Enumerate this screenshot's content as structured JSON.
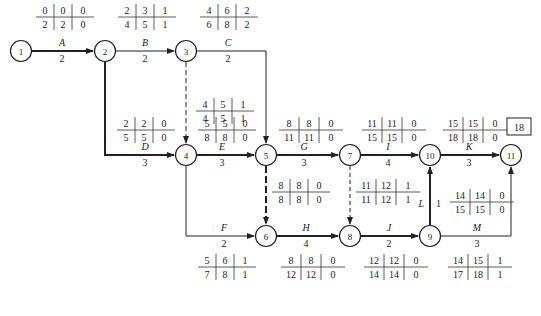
{
  "total_duration": "18",
  "nodes": [
    {
      "id": "1",
      "x": 21,
      "y": 51
    },
    {
      "id": "2",
      "x": 105,
      "y": 51
    },
    {
      "id": "3",
      "x": 186,
      "y": 51
    },
    {
      "id": "4",
      "x": 186,
      "y": 155
    },
    {
      "id": "5",
      "x": 266,
      "y": 155
    },
    {
      "id": "6",
      "x": 266,
      "y": 236
    },
    {
      "id": "7",
      "x": 350,
      "y": 155
    },
    {
      "id": "8",
      "x": 350,
      "y": 236
    },
    {
      "id": "9",
      "x": 430,
      "y": 236
    },
    {
      "id": "10",
      "x": 430,
      "y": 155
    },
    {
      "id": "11",
      "x": 511,
      "y": 155
    }
  ],
  "activities": [
    {
      "name": "A",
      "duration": "2",
      "from": "1",
      "to": "2",
      "critical": true,
      "es": "0",
      "ef": "2",
      "tf": "0",
      "ls": "0",
      "lf": "2",
      "ff": "0"
    },
    {
      "name": "B",
      "duration": "2",
      "from": "2",
      "to": "3",
      "critical": false,
      "es": "2",
      "ef": "4",
      "ls": "3",
      "lf": "5",
      "tf": "1",
      "ff": "1"
    },
    {
      "name": "C",
      "duration": "2",
      "from": "3",
      "to": "5",
      "critical": false,
      "es": "4",
      "ef": "6",
      "ls": "6",
      "lf": "8",
      "tf": "2",
      "ff": "2"
    },
    {
      "name": "D",
      "duration": "3",
      "from": "2",
      "to": "4",
      "critical": true,
      "es": "2",
      "ef": "5",
      "ls": "2",
      "lf": "5",
      "tf": "0",
      "ff": "0"
    },
    {
      "name": "E",
      "duration": "3",
      "from": "4",
      "to": "5",
      "critical": true,
      "es": "5",
      "ef": "8",
      "ls": "5",
      "lf": "8",
      "tf": "0",
      "ff": "0"
    },
    {
      "name": "F",
      "duration": "2",
      "from": "4",
      "to": "6",
      "critical": false,
      "es": "5",
      "ef": "7",
      "ls": "6",
      "lf": "8",
      "tf": "1",
      "ff": "1"
    },
    {
      "name": "G",
      "duration": "3",
      "from": "5",
      "to": "7",
      "critical": true,
      "es": "8",
      "ef": "11",
      "ls": "8",
      "lf": "11",
      "tf": "0",
      "ff": "0"
    },
    {
      "name": "H",
      "duration": "4",
      "from": "6",
      "to": "8",
      "critical": true,
      "es": "8",
      "ef": "12",
      "ls": "8",
      "lf": "12",
      "tf": "0",
      "ff": "0"
    },
    {
      "name": "I",
      "duration": "4",
      "from": "7",
      "to": "10",
      "critical": true,
      "es": "11",
      "ef": "15",
      "ls": "11",
      "lf": "15",
      "tf": "0",
      "ff": "0"
    },
    {
      "name": "J",
      "duration": "2",
      "from": "8",
      "to": "9",
      "critical": true,
      "es": "12",
      "ef": "14",
      "ls": "12",
      "lf": "14",
      "tf": "0",
      "ff": "0"
    },
    {
      "name": "K",
      "duration": "3",
      "from": "10",
      "to": "11",
      "critical": true,
      "es": "15",
      "ef": "18",
      "ls": "15",
      "lf": "18",
      "tf": "0",
      "ff": "0"
    },
    {
      "name": "L",
      "duration": "1",
      "from": "9",
      "to": "10",
      "critical": true,
      "es": "14",
      "ef": "15",
      "ls": "14",
      "lf": "15",
      "tf": "0",
      "ff": "0"
    },
    {
      "name": "M",
      "duration": "3",
      "from": "9",
      "to": "11",
      "critical": false,
      "es": "14",
      "ef": "17",
      "ls": "15",
      "lf": "18",
      "tf": "1",
      "ff": "1"
    }
  ],
  "dummies": [
    {
      "from": "3",
      "to": "4",
      "critical": false,
      "es": "4",
      "ef": "4",
      "ls": "5",
      "lf": "5",
      "tf": "1",
      "ff": "1"
    },
    {
      "from": "5",
      "to": "6",
      "critical": true,
      "es": "8",
      "ef": "8",
      "ls": "8",
      "lf": "8",
      "tf": "0",
      "ff": "0"
    },
    {
      "from": "7",
      "to": "8",
      "critical": false,
      "es": "11",
      "ef": "11",
      "ls": "12",
      "lf": "12",
      "tf": "1",
      "ff": "1"
    }
  ],
  "tables": {
    "A": {
      "r1": [
        "0",
        "0",
        "0"
      ],
      "r2": [
        "2",
        "2",
        "0"
      ]
    },
    "B": {
      "r1": [
        "2",
        "3",
        "1"
      ],
      "r2": [
        "4",
        "5",
        "1"
      ]
    },
    "C": {
      "r1": [
        "4",
        "6",
        "2"
      ],
      "r2": [
        "6",
        "8",
        "2"
      ]
    },
    "D": {
      "r1": [
        "2",
        "2",
        "0"
      ],
      "r2": [
        "5",
        "5",
        "0"
      ]
    },
    "E": {
      "r1": [
        "5",
        "5",
        "0"
      ],
      "r2": [
        "8",
        "8",
        "0"
      ]
    },
    "F": {
      "r1": [
        "5",
        "6",
        "1"
      ],
      "r2": [
        "7",
        "8",
        "1"
      ]
    },
    "G": {
      "r1": [
        "8",
        "8",
        "0"
      ],
      "r2": [
        "11",
        "11",
        "0"
      ]
    },
    "H": {
      "r1": [
        "8",
        "8",
        "0"
      ],
      "r2": [
        "12",
        "12",
        "0"
      ]
    },
    "I": {
      "r1": [
        "11",
        "11",
        "0"
      ],
      "r2": [
        "15",
        "15",
        "0"
      ]
    },
    "J": {
      "r1": [
        "12",
        "12",
        "0"
      ],
      "r2": [
        "14",
        "14",
        "0"
      ]
    },
    "K": {
      "r1": [
        "15",
        "15",
        "0"
      ],
      "r2": [
        "18",
        "18",
        "0"
      ]
    },
    "L": {
      "r1": [
        "14",
        "14",
        "0"
      ],
      "r2": [
        "15",
        "15",
        "0"
      ]
    },
    "M": {
      "r1": [
        "14",
        "15",
        "1"
      ],
      "r2": [
        "17",
        "18",
        "1"
      ]
    },
    "d34": {
      "r1": [
        "4",
        "5",
        "1"
      ],
      "r2": [
        "4",
        "5",
        "1"
      ]
    },
    "d56": {
      "r1": [
        "8",
        "8",
        "0"
      ],
      "r2": [
        "8",
        "8",
        "0"
      ]
    },
    "d78": {
      "r1": [
        "11",
        "12",
        "1"
      ],
      "r2": [
        "11",
        "12",
        "1"
      ]
    }
  }
}
